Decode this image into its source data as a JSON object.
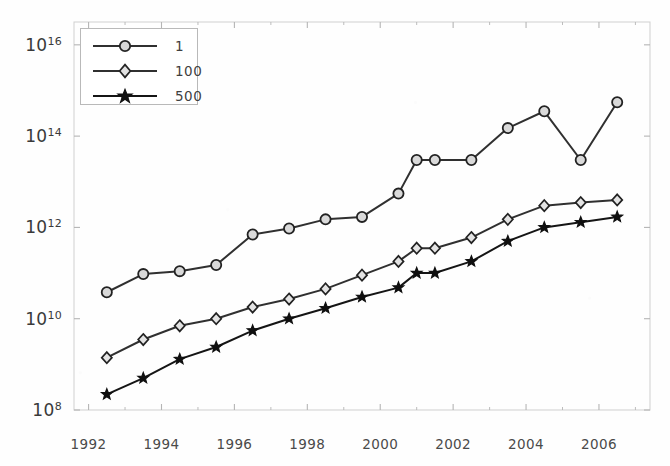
{
  "chart_data": {
    "type": "line",
    "title": "",
    "xlabel": "",
    "ylabel": "",
    "yscale": "log",
    "ylim": [
      100000000,
      31622776601683790
    ],
    "xlim": [
      1991.6,
      2007.4
    ],
    "grid": false,
    "legend_position": "top-left",
    "x": [
      1992.5,
      1993.5,
      1994.5,
      1995.5,
      1996.5,
      1997.5,
      1998.5,
      1999.5,
      2000.5,
      2001.0,
      2001.5,
      2002.5,
      2003.5,
      2004.5,
      2005.5,
      2006.5
    ],
    "xtick_labels": [
      "1992",
      "1994",
      "1996",
      "1998",
      "2000",
      "2002",
      "2004",
      "2006"
    ],
    "xtick_values": [
      1992,
      1994,
      1996,
      1998,
      2000,
      2002,
      2004,
      2006
    ],
    "xminor_ticks": [
      1993,
      1995,
      1997,
      1999,
      2001,
      2003,
      2005,
      2007
    ],
    "ytick_labels": [
      "10^8",
      "10^10",
      "10^12",
      "10^14",
      "10^16"
    ],
    "ytick_values": [
      100000000,
      10000000000,
      1000000000000,
      100000000000000,
      10000000000000000
    ],
    "series": [
      {
        "name": "1",
        "marker": "open-circle",
        "color": "#303030",
        "values": [
          38000000000.0,
          95000000000.0,
          110000000000.0,
          150000000000.0,
          700000000000.0,
          950000000000.0,
          1500000000000.0,
          1700000000000.0,
          5500000000000.0,
          30000000000000.0,
          30000000000000.0,
          30000000000000.0,
          150000000000000.0,
          350000000000000.0,
          30000000000000.0,
          550000000000000.0
        ]
      },
      {
        "name": "100",
        "marker": "open-diamond",
        "color": "#303030",
        "values": [
          1400000000.0,
          3500000000.0,
          7000000000.0,
          10000000000.0,
          18000000000.0,
          27000000000.0,
          45000000000.0,
          90000000000.0,
          180000000000.0,
          350000000000.0,
          350000000000.0,
          600000000000.0,
          1500000000000.0,
          3000000000000.0,
          3500000000000.0,
          4000000000000.0
        ]
      },
      {
        "name": "500",
        "marker": "filled-star",
        "color": "#151515",
        "values": [
          220000000.0,
          500000000.0,
          1300000000.0,
          2400000000.0,
          5500000000.0,
          10000000000.0,
          17000000000.0,
          30000000000.0,
          48000000000.0,
          100000000000.0,
          100000000000.0,
          180000000000.0,
          500000000000.0,
          1000000000000.0,
          1300000000000.0,
          1700000000000.0
        ]
      }
    ]
  },
  "legend": {
    "items": [
      {
        "label": "1"
      },
      {
        "label": "100"
      },
      {
        "label": "500"
      }
    ]
  },
  "axis": {
    "frame_color": "#cfcfcf",
    "tick_color": "#b5b5b5",
    "label_color": "#3a3a3a"
  }
}
